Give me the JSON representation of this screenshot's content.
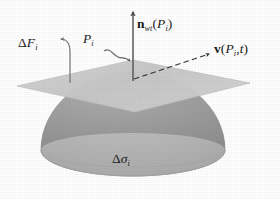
{
  "figure": {
    "background_color": "#ffffff",
    "width": 280,
    "height": 199
  },
  "geometry": {
    "plane": {
      "name": "tangent-plane",
      "fill_color": "#c9c9c9",
      "points": "17,86 133,60 250,83 135,112",
      "description": "light gray parallelogram representing the horizontal plane"
    },
    "dome": {
      "name": "hemisphere-dome",
      "upper_fill_color": "#9d9d9d",
      "lower_fill_color": "#b9b9b9",
      "base_fill_color": "#c2c2c2",
      "outline_color": "#8a8a8a",
      "center_x": 133,
      "base_y": 150,
      "radius_x": 92,
      "radius_y": 78,
      "seam_radius_y": 17,
      "description": "dome with darker upper cap and lighter lower band separated by an elliptical seam"
    },
    "origin": {
      "x": 133,
      "y": 79
    }
  },
  "vectors": {
    "normal": {
      "name": "normal-vector-arrow",
      "from": {
        "x": 133,
        "y": 80
      },
      "to": {
        "x": 133,
        "y": 10
      },
      "style": "solid",
      "color": "#555555"
    },
    "velocity": {
      "name": "velocity-vector-arrow",
      "from": {
        "x": 134,
        "y": 79
      },
      "to": {
        "x": 211,
        "y": 53
      },
      "style": "dashed",
      "color": "#3a3a3a"
    },
    "force": {
      "name": "force-vector-arrow",
      "from": {
        "x": 70,
        "y": 82
      },
      "to": {
        "x": 64,
        "y": 40
      },
      "style": "solid-curved",
      "color": "#777777"
    },
    "point_leader": {
      "name": "point-leader-arrow",
      "from": {
        "x": 103,
        "y": 50
      },
      "to": {
        "x": 130,
        "y": 62
      },
      "style": "wavy",
      "color": "#6d6d6d"
    }
  },
  "labels": {
    "normal": {
      "name": "normal-vector-label",
      "symbol": "n",
      "subscript": "wt",
      "argument_open": "(",
      "argument_symbol": "P",
      "argument_subscript": "i",
      "argument_close": ")",
      "text": "n_wt(P_i)"
    },
    "velocity": {
      "name": "velocity-vector-label",
      "symbol": "v",
      "argument_open": "(",
      "argument_symbol": "P",
      "argument_subscript": "i",
      "separator": ",",
      "argument_second": "t",
      "argument_close": ")",
      "text": "v(P_i, t)"
    },
    "force": {
      "name": "force-label",
      "delta": "Δ",
      "symbol": "F",
      "subscript": "i",
      "text": "ΔF_i"
    },
    "point": {
      "name": "point-label",
      "symbol": "P",
      "subscript": "i",
      "text": "P_i"
    },
    "sigma": {
      "name": "surface-element-label",
      "delta": "Δ",
      "symbol": "σ",
      "subscript": "i",
      "text": "Δσ_i"
    }
  }
}
